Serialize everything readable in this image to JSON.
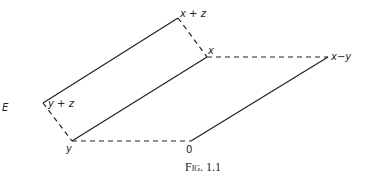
{
  "figure": {
    "space_label": "E",
    "caption": "Fig. 1.1",
    "points": {
      "x_plus_z": "x + z",
      "x": "x",
      "x_minus_y": "x−y",
      "y_plus_z": "y + z",
      "y": "y",
      "origin": "0"
    },
    "coords": {
      "x_plus_z": [
        178,
        18
      ],
      "x": [
        207,
        57
      ],
      "x_minus_y": [
        328,
        57
      ],
      "y_plus_z": [
        43,
        103
      ],
      "y": [
        72,
        141
      ],
      "origin": [
        191,
        141
      ]
    },
    "solid_segments": [
      [
        "x_plus_z",
        "y_plus_z"
      ],
      [
        "x",
        "y"
      ],
      [
        "x_minus_y",
        "origin"
      ]
    ],
    "dashed_segments": [
      [
        "x_plus_z",
        "x"
      ],
      [
        "y_plus_z",
        "y"
      ],
      [
        "x",
        "x_minus_y"
      ],
      [
        "y",
        "origin"
      ]
    ],
    "line_color": "#222222"
  }
}
